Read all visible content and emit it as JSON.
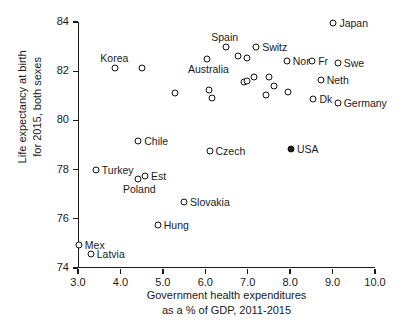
{
  "chart_data": {
    "type": "scatter",
    "title": "",
    "xlabel": "Government health expenditures as a % of GDP, 2011-2015",
    "xlabel_line1": "Government health expenditures",
    "xlabel_line2": "as a % of GDP, 2011-2015",
    "ylabel": "Life expectancy at birth for 2015, both sexes",
    "ylabel_line1": "Life expectancy at birth",
    "ylabel_line2": "for 2015, both sexes",
    "xlim": [
      3.0,
      10.0
    ],
    "ylim": [
      74,
      84
    ],
    "xticks": [
      "3.0",
      "4.0",
      "5.0",
      "6.0",
      "7.0",
      "8.0",
      "9.0",
      "10.0"
    ],
    "xtick_values": [
      3.0,
      4.0,
      5.0,
      6.0,
      7.0,
      8.0,
      9.0,
      10.0
    ],
    "yticks": [
      "74",
      "76",
      "78",
      "80",
      "82",
      "84"
    ],
    "ytick_values": [
      74,
      76,
      78,
      80,
      82,
      84
    ],
    "grid": false,
    "legend": "none",
    "marker_style": "open-circle",
    "highlight_marker_style": "filled-circle",
    "points": [
      {
        "label": "Japan",
        "x": 9.02,
        "y": 83.95,
        "filled": false,
        "label_pos": "right"
      },
      {
        "label": "Spain",
        "x": 6.48,
        "y": 83.0,
        "filled": false,
        "label_pos": "above"
      },
      {
        "label": "Switz",
        "x": 7.2,
        "y": 83.0,
        "filled": false,
        "label_pos": "right"
      },
      {
        "label": "Korea",
        "x": 3.88,
        "y": 82.15,
        "filled": false,
        "label_pos": "above"
      },
      {
        "label": "",
        "x": 4.52,
        "y": 82.15,
        "filled": false,
        "label_pos": "none"
      },
      {
        "label": "Australia",
        "x": 6.05,
        "y": 82.5,
        "filled": false,
        "label_pos": "below"
      },
      {
        "label": "",
        "x": 6.78,
        "y": 82.6,
        "filled": false,
        "label_pos": "none"
      },
      {
        "label": "",
        "x": 6.98,
        "y": 82.52,
        "filled": false,
        "label_pos": "none"
      },
      {
        "label": "Nor",
        "x": 7.92,
        "y": 82.42,
        "filled": false,
        "label_pos": "right"
      },
      {
        "label": "Fr",
        "x": 8.52,
        "y": 82.42,
        "filled": false,
        "label_pos": "right"
      },
      {
        "label": "Swe",
        "x": 9.12,
        "y": 82.32,
        "filled": false,
        "label_pos": "right"
      },
      {
        "label": "Neth",
        "x": 8.72,
        "y": 81.65,
        "filled": false,
        "label_pos": "right"
      },
      {
        "label": "",
        "x": 6.92,
        "y": 81.58,
        "filled": false,
        "label_pos": "none"
      },
      {
        "label": "",
        "x": 6.98,
        "y": 81.62,
        "filled": false,
        "label_pos": "none"
      },
      {
        "label": "",
        "x": 7.15,
        "y": 81.78,
        "filled": false,
        "label_pos": "none"
      },
      {
        "label": "",
        "x": 7.5,
        "y": 81.78,
        "filled": false,
        "label_pos": "none"
      },
      {
        "label": "",
        "x": 7.62,
        "y": 81.38,
        "filled": false,
        "label_pos": "none"
      },
      {
        "label": "",
        "x": 7.42,
        "y": 81.02,
        "filled": false,
        "label_pos": "none"
      },
      {
        "label": "",
        "x": 7.95,
        "y": 81.15,
        "filled": false,
        "label_pos": "none"
      },
      {
        "label": "",
        "x": 5.28,
        "y": 81.12,
        "filled": false,
        "label_pos": "none"
      },
      {
        "label": "",
        "x": 6.08,
        "y": 81.22,
        "filled": false,
        "label_pos": "none"
      },
      {
        "label": "",
        "x": 6.15,
        "y": 80.92,
        "filled": false,
        "label_pos": "none"
      },
      {
        "label": "Dk",
        "x": 8.55,
        "y": 80.85,
        "filled": false,
        "label_pos": "right"
      },
      {
        "label": "Germany",
        "x": 9.12,
        "y": 80.72,
        "filled": false,
        "label_pos": "right"
      },
      {
        "label": "Chile",
        "x": 4.42,
        "y": 79.15,
        "filled": false,
        "label_pos": "right"
      },
      {
        "label": "Czech",
        "x": 6.1,
        "y": 78.75,
        "filled": false,
        "label_pos": "right"
      },
      {
        "label": "USA",
        "x": 8.02,
        "y": 78.85,
        "filled": true,
        "label_pos": "right"
      },
      {
        "label": "Turkey",
        "x": 3.42,
        "y": 78.0,
        "filled": false,
        "label_pos": "right"
      },
      {
        "label": "Poland",
        "x": 4.42,
        "y": 77.62,
        "filled": false,
        "label_pos": "below"
      },
      {
        "label": "Est",
        "x": 4.58,
        "y": 77.72,
        "filled": false,
        "label_pos": "right"
      },
      {
        "label": "Slovakia",
        "x": 5.5,
        "y": 76.7,
        "filled": false,
        "label_pos": "right"
      },
      {
        "label": "Hung",
        "x": 4.88,
        "y": 75.75,
        "filled": false,
        "label_pos": "right"
      },
      {
        "label": "Mex",
        "x": 3.02,
        "y": 74.95,
        "filled": false,
        "label_pos": "right"
      },
      {
        "label": "Latvia",
        "x": 3.3,
        "y": 74.58,
        "filled": false,
        "label_pos": "right"
      }
    ]
  },
  "colors": {
    "axis": "#1a1a1a",
    "marker_stroke": "#111111",
    "marker_fill_open": "#ffffff",
    "marker_fill_highlight": "#1a1a1a",
    "text": "#1a1a1a",
    "background": "#ffffff"
  }
}
